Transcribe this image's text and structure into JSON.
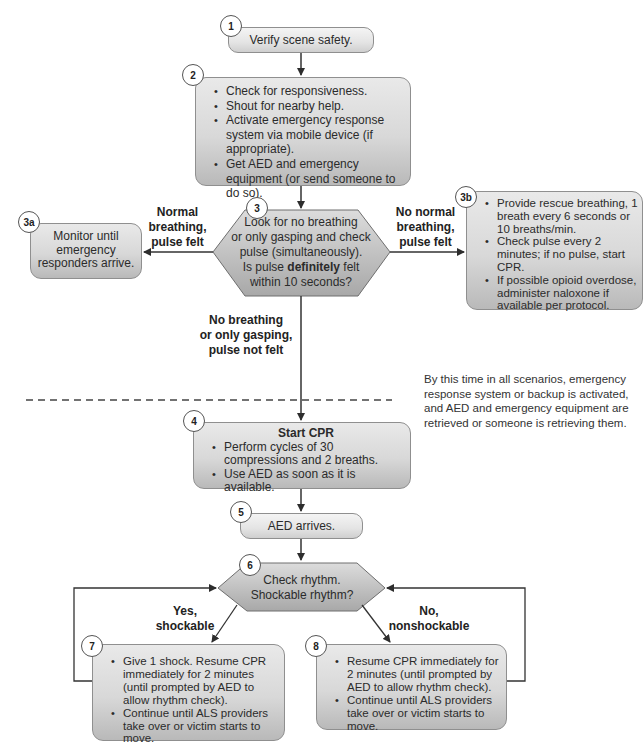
{
  "steps": {
    "s1": {
      "badge": "1",
      "text": "Verify scene safety."
    },
    "s2": {
      "badge": "2",
      "items": [
        "Check for responsiveness.",
        "Shout for nearby help.",
        "Activate emergency response system via mobile device (if appropriate).",
        "Get AED and emergency equipment (or send someone to do so)."
      ]
    },
    "s3": {
      "badge": "3",
      "line1": "Look for no breathing",
      "line2": "or only gasping and check",
      "line3": "pulse (simultaneously).",
      "line4_pre": "Is pulse ",
      "line4_bold": "definitely",
      "line4_post": " felt",
      "line5": "within 10 seconds?"
    },
    "s3a": {
      "badge": "3a",
      "text": "Monitor until emergency responders arrive."
    },
    "s3b": {
      "badge": "3b",
      "items": [
        "Provide rescue breathing, 1 breath every 6 seconds or 10 breaths/min.",
        "Check pulse every 2 minutes; if no pulse, start CPR.",
        "If possible opioid overdose, administer naloxone if available per protocol."
      ]
    },
    "s4": {
      "badge": "4",
      "title": "Start CPR",
      "items": [
        "Perform cycles of 30 compressions and 2 breaths.",
        "Use AED as soon as it is available."
      ]
    },
    "s5": {
      "badge": "5",
      "text": "AED arrives."
    },
    "s6": {
      "badge": "6",
      "line1": "Check rhythm.",
      "line2": "Shockable rhythm?"
    },
    "s7": {
      "badge": "7",
      "items": [
        "Give 1 shock. Resume CPR immediately for 2 minutes (until prompted by AED to allow rhythm check).",
        "Continue until ALS providers take over or victim starts to move."
      ]
    },
    "s8": {
      "badge": "8",
      "items": [
        "Resume CPR immediately for 2 minutes (until prompted by AED to allow rhythm check).",
        "Continue until ALS providers take over or victim starts to move."
      ]
    }
  },
  "edge_labels": {
    "normal": {
      "l1": "Normal",
      "l2": "breathing,",
      "l3": "pulse felt"
    },
    "no_normal": {
      "l1": "No normal",
      "l2": "breathing,",
      "l3": "pulse felt"
    },
    "no_breathing": {
      "l1": "No breathing",
      "l2": "or only gasping,",
      "l3": "pulse not felt"
    },
    "yes": {
      "l1": "Yes,",
      "l2": "shockable"
    },
    "no": {
      "l1": "No,",
      "l2": "nonshockable"
    }
  },
  "note": "By this time in all scenarios, emergency response system or backup is activated, and AED and emergency equipment are retrieved or someone is retrieving them.",
  "colors": {
    "line": "#3a3a3a",
    "box_top": "#e9e9e9",
    "box_bottom": "#b9b9b9",
    "hex_fill": "#bdbdbd"
  }
}
